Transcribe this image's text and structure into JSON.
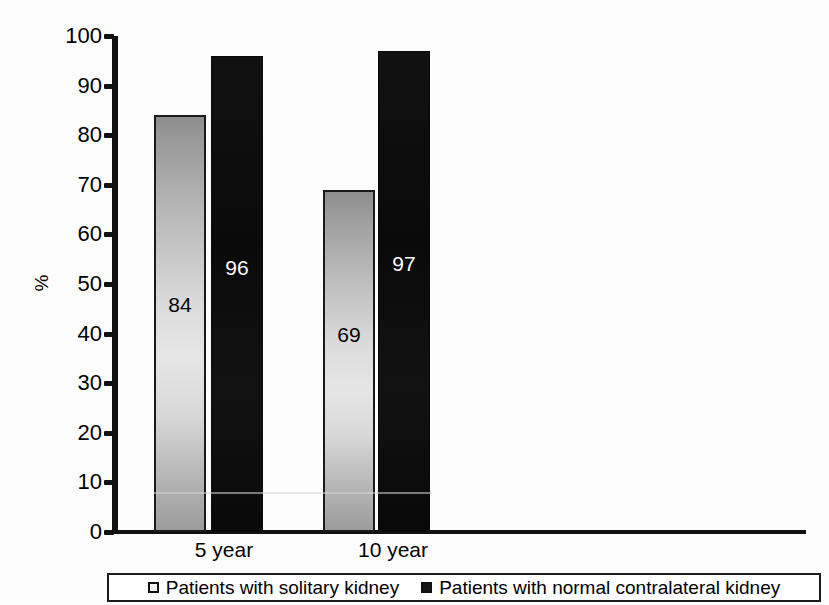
{
  "chart_data": {
    "type": "bar",
    "title": "",
    "subtitle": "",
    "xlabel": "",
    "ylabel": "%",
    "categories": [
      "5 year",
      "10 year"
    ],
    "series": [
      {
        "name": "Patients with solitary kidney",
        "values": [
          84,
          69
        ],
        "color": "#d8d8d8",
        "marker": "light-square"
      },
      {
        "name": "Patients with normal contralateral kidney",
        "values": [
          96,
          97
        ],
        "color": "#111111",
        "marker": "dark-square"
      }
    ],
    "ylim": [
      0,
      100
    ],
    "yticks": [
      0,
      10,
      20,
      30,
      40,
      50,
      60,
      70,
      80,
      90,
      100
    ],
    "ytick_labels": [
      "0",
      "10",
      "20",
      "30",
      "40",
      "50",
      "60",
      "70",
      "80",
      "90",
      "100"
    ],
    "grid": false,
    "legend_position": "bottom",
    "data_labels": [
      "84",
      "96",
      "69",
      "97"
    ]
  },
  "axis": {
    "y_title": "%",
    "ticks": [
      {
        "value": 100,
        "label": "100"
      },
      {
        "value": 90,
        "label": "90"
      },
      {
        "value": 80,
        "label": "80"
      },
      {
        "value": 70,
        "label": "70"
      },
      {
        "value": 60,
        "label": "60"
      },
      {
        "value": 50,
        "label": "50"
      },
      {
        "value": 40,
        "label": "40"
      },
      {
        "value": 30,
        "label": "30"
      },
      {
        "value": 20,
        "label": "20"
      },
      {
        "value": 10,
        "label": "10"
      },
      {
        "value": 0,
        "label": "0"
      }
    ]
  },
  "categories": [
    {
      "label": "5 year"
    },
    {
      "label": "10 year"
    }
  ],
  "bars": [
    {
      "value": 84,
      "label": "84",
      "style": "light",
      "group": "5 year",
      "series": "Patients with solitary kidney"
    },
    {
      "value": 96,
      "label": "96",
      "style": "dark",
      "group": "5 year",
      "series": "Patients with normal contralateral kidney"
    },
    {
      "value": 69,
      "label": "69",
      "style": "light",
      "group": "10 year",
      "series": "Patients with solitary kidney"
    },
    {
      "value": 97,
      "label": "97",
      "style": "dark",
      "group": "10 year",
      "series": "Patients with normal contralateral kidney"
    }
  ],
  "legend": {
    "entries": [
      {
        "label": "Patients with solitary kidney",
        "swatch": "light"
      },
      {
        "label": "Patients with normal contralateral kidney",
        "swatch": "dark"
      }
    ]
  },
  "colors": {
    "axis": "#111111",
    "bar_light_top": "#8e8e8e",
    "bar_light_bottom": "#e6e6e6",
    "bar_dark": "#111111",
    "background": "#ffffff"
  }
}
